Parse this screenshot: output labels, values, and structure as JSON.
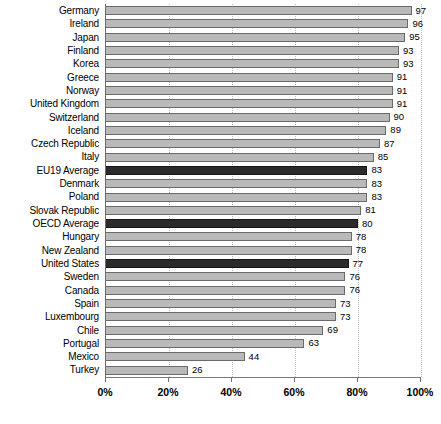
{
  "chart_data": {
    "type": "bar",
    "orientation": "horizontal",
    "title": "",
    "subtitle": "",
    "xlabel": "",
    "ylabel": "",
    "xlim": [
      0,
      100
    ],
    "xtick_labels": [
      "0%",
      "20%",
      "40%",
      "60%",
      "80%",
      "100%"
    ],
    "xticks": [
      0,
      20,
      40,
      60,
      80,
      100
    ],
    "grid": true,
    "grid_axis": "x",
    "legend": null,
    "value_unit": "%",
    "categories": [
      "Germany",
      "Ireland",
      "Japan",
      "Finland",
      "Korea",
      "Greece",
      "Norway",
      "United Kingdom",
      "Switzerland",
      "Iceland",
      "Czech Republic",
      "Italy",
      "EU19 Average",
      "Denmark",
      "Poland",
      "Slovak Republic",
      "OECD Average",
      "Hungary",
      "New Zealand",
      "United States",
      "Sweden",
      "Canada",
      "Spain",
      "Luxembourg",
      "Chile",
      "Portugal",
      "Mexico",
      "Turkey"
    ],
    "values": [
      97,
      96,
      95,
      93,
      93,
      91,
      91,
      91,
      90,
      89,
      87,
      85,
      83,
      83,
      83,
      81,
      80,
      78,
      78,
      77,
      76,
      76,
      73,
      73,
      69,
      63,
      44,
      26
    ],
    "value_labels": [
      "97",
      "96",
      "95",
      "93",
      "93",
      "91",
      "91",
      "91",
      "90",
      "89",
      "87",
      "85",
      "83",
      "83",
      "83",
      "81",
      "80",
      "78",
      "78",
      "77",
      "76",
      "76",
      "73",
      "73",
      "69",
      "63",
      "44",
      "26"
    ],
    "highlighted": [
      false,
      false,
      false,
      false,
      false,
      false,
      false,
      false,
      false,
      false,
      false,
      false,
      true,
      false,
      false,
      false,
      true,
      false,
      false,
      true,
      false,
      false,
      false,
      false,
      false,
      false,
      false,
      false
    ],
    "colors": {
      "bar_fill": "#b9b9b9",
      "bar_border": "#6a6a6a",
      "highlight_fill": "#2b2b2b",
      "highlight_border": "#151515",
      "gridline": "#bdbdbd",
      "axis": "#6e6e6e",
      "text": "#000000",
      "background": "#ffffff"
    }
  }
}
